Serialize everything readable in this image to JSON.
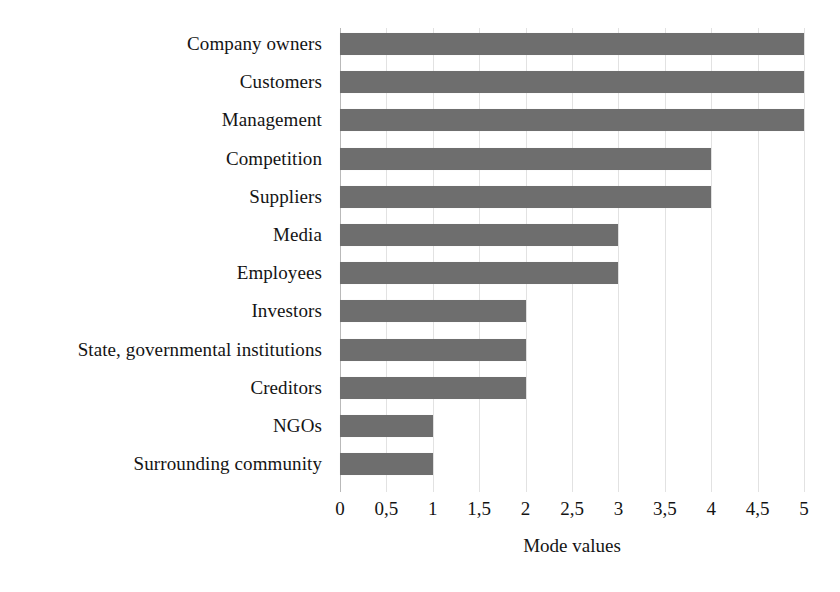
{
  "chart_data": {
    "type": "bar",
    "orientation": "horizontal",
    "title": "",
    "xlabel": "Mode values",
    "ylabel": "",
    "categories": [
      "Company owners",
      "Customers",
      "Management",
      "Competition",
      "Suppliers",
      "Media",
      "Employees",
      "Investors",
      "State, governmental institutions",
      "Creditors",
      "NGOs",
      "Surrounding community"
    ],
    "values": [
      5,
      5,
      5,
      4,
      4,
      3,
      3,
      2,
      2,
      2,
      1,
      1
    ],
    "xlim": [
      0,
      5
    ],
    "xticks": [
      0,
      0.5,
      1,
      1.5,
      2,
      2.5,
      3,
      3.5,
      4,
      4.5,
      5
    ],
    "xtick_labels": [
      "0",
      "0,5",
      "1",
      "1,5",
      "2",
      "2,5",
      "3",
      "3,5",
      "4",
      "4,5",
      "5"
    ],
    "grid": true,
    "grid_axis": "x",
    "legend": false,
    "bar_color": "#6e6e6e",
    "grid_color": "#e2e2e2",
    "axis_color": "#b9b9b9",
    "background": "#ffffff",
    "text_color": "#141414"
  }
}
